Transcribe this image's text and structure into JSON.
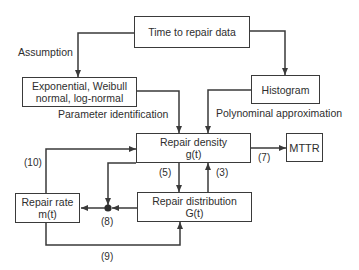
{
  "diagram": {
    "boxes": {
      "time_to_repair": {
        "lines": [
          "Time to repair data"
        ]
      },
      "distributions": {
        "lines": [
          "Exponential, Weibull",
          "normal, log-normal"
        ]
      },
      "histogram": {
        "lines": [
          "Histogram"
        ]
      },
      "repair_density": {
        "lines": [
          "Repair density",
          "g(t)"
        ]
      },
      "mttr": {
        "lines": [
          "MTTR"
        ]
      },
      "repair_distribution": {
        "lines": [
          "Repair distribution",
          "G(t)"
        ]
      },
      "repair_rate": {
        "lines": [
          "Repair rate",
          "m(t)"
        ]
      }
    },
    "edge_labels": {
      "assumption": "Assumption",
      "parameter_identification": "Parameter identification",
      "polynomial_approximation": "Polynominal approximation",
      "e3": "(3)",
      "e5": "(5)",
      "e7": "(7)",
      "e8": "(8)",
      "e9": "(9)",
      "e10": "(10)"
    },
    "colors": {
      "line": "#3a3a3a",
      "text": "#2e2e2e",
      "background": "#ffffff"
    }
  }
}
